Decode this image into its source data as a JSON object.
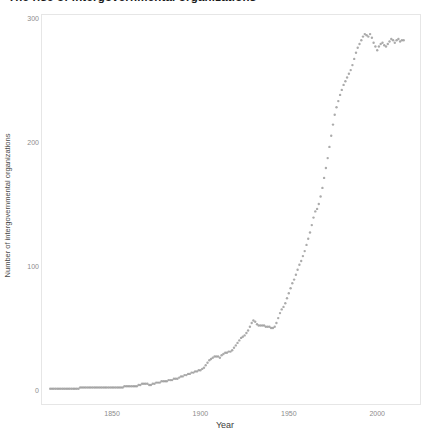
{
  "title": {
    "text": "The rise of intergovernmental organizations"
  },
  "colors": {
    "point": "#969696",
    "panel_border": "#e6e6e6",
    "tick_text": "#8c8c8c",
    "axis_title_text": "#4a4a4a",
    "background": "#ffffff"
  },
  "chart_data": {
    "type": "scatter",
    "title": "The rise of intergovernmental organizations",
    "xlabel": "Year",
    "ylabel": "Number of intergovernmental organizations",
    "x_ticks": [
      1850,
      1900,
      1950,
      2000
    ],
    "y_ticks": [
      0,
      100,
      200,
      300
    ],
    "xlim": [
      1809.8,
      2024.8
    ],
    "ylim": [
      -12.1,
      303.2
    ],
    "grid": false,
    "legend": "none",
    "series": [
      {
        "name": "igo-count",
        "points": [
          [
            1815,
            1
          ],
          [
            1816,
            1
          ],
          [
            1817,
            1
          ],
          [
            1818,
            1
          ],
          [
            1819,
            1
          ],
          [
            1820,
            1
          ],
          [
            1821,
            1
          ],
          [
            1822,
            1
          ],
          [
            1823,
            1
          ],
          [
            1824,
            1
          ],
          [
            1825,
            1
          ],
          [
            1826,
            1
          ],
          [
            1827,
            1
          ],
          [
            1828,
            1
          ],
          [
            1829,
            1
          ],
          [
            1830,
            1
          ],
          [
            1831,
            1
          ],
          [
            1832,
            2
          ],
          [
            1833,
            2
          ],
          [
            1834,
            2
          ],
          [
            1835,
            2
          ],
          [
            1836,
            2
          ],
          [
            1837,
            2
          ],
          [
            1838,
            2
          ],
          [
            1839,
            2
          ],
          [
            1840,
            2
          ],
          [
            1841,
            2
          ],
          [
            1842,
            2
          ],
          [
            1843,
            2
          ],
          [
            1844,
            2
          ],
          [
            1845,
            2
          ],
          [
            1846,
            2
          ],
          [
            1847,
            2
          ],
          [
            1848,
            2
          ],
          [
            1849,
            2
          ],
          [
            1850,
            2
          ],
          [
            1851,
            2
          ],
          [
            1852,
            2
          ],
          [
            1853,
            2
          ],
          [
            1854,
            2
          ],
          [
            1855,
            2
          ],
          [
            1856,
            2
          ],
          [
            1857,
            3
          ],
          [
            1858,
            3
          ],
          [
            1859,
            3
          ],
          [
            1860,
            3
          ],
          [
            1861,
            3
          ],
          [
            1862,
            3
          ],
          [
            1863,
            3
          ],
          [
            1864,
            3
          ],
          [
            1865,
            4
          ],
          [
            1866,
            4
          ],
          [
            1867,
            5
          ],
          [
            1868,
            5
          ],
          [
            1869,
            5
          ],
          [
            1870,
            5
          ],
          [
            1871,
            4
          ],
          [
            1872,
            4
          ],
          [
            1873,
            5
          ],
          [
            1874,
            5
          ],
          [
            1875,
            6
          ],
          [
            1876,
            6
          ],
          [
            1877,
            6
          ],
          [
            1878,
            7
          ],
          [
            1879,
            7
          ],
          [
            1880,
            7
          ],
          [
            1881,
            7
          ],
          [
            1882,
            8
          ],
          [
            1883,
            8
          ],
          [
            1884,
            8
          ],
          [
            1885,
            9
          ],
          [
            1886,
            9
          ],
          [
            1887,
            9
          ],
          [
            1888,
            10
          ],
          [
            1889,
            11
          ],
          [
            1890,
            11
          ],
          [
            1891,
            12
          ],
          [
            1892,
            12
          ],
          [
            1893,
            13
          ],
          [
            1894,
            13
          ],
          [
            1895,
            14
          ],
          [
            1896,
            14
          ],
          [
            1897,
            15
          ],
          [
            1898,
            15
          ],
          [
            1899,
            16
          ],
          [
            1900,
            16
          ],
          [
            1901,
            17
          ],
          [
            1902,
            18
          ],
          [
            1903,
            20
          ],
          [
            1904,
            22
          ],
          [
            1905,
            24
          ],
          [
            1906,
            25
          ],
          [
            1907,
            26
          ],
          [
            1908,
            27
          ],
          [
            1909,
            27
          ],
          [
            1910,
            27
          ],
          [
            1911,
            26
          ],
          [
            1912,
            28
          ],
          [
            1913,
            29
          ],
          [
            1914,
            30
          ],
          [
            1915,
            30
          ],
          [
            1916,
            31
          ],
          [
            1917,
            31
          ],
          [
            1918,
            32
          ],
          [
            1919,
            34
          ],
          [
            1920,
            36
          ],
          [
            1921,
            38
          ],
          [
            1922,
            40
          ],
          [
            1923,
            42
          ],
          [
            1924,
            43
          ],
          [
            1925,
            44
          ],
          [
            1926,
            46
          ],
          [
            1927,
            48
          ],
          [
            1928,
            51
          ],
          [
            1929,
            54
          ],
          [
            1930,
            56
          ],
          [
            1931,
            55
          ],
          [
            1932,
            53
          ],
          [
            1933,
            52
          ],
          [
            1934,
            52
          ],
          [
            1935,
            52
          ],
          [
            1936,
            52
          ],
          [
            1937,
            51
          ],
          [
            1938,
            51
          ],
          [
            1939,
            51
          ],
          [
            1940,
            50
          ],
          [
            1941,
            50
          ],
          [
            1942,
            51
          ],
          [
            1943,
            54
          ],
          [
            1944,
            58
          ],
          [
            1945,
            62
          ],
          [
            1946,
            65
          ],
          [
            1947,
            67
          ],
          [
            1948,
            70
          ],
          [
            1949,
            74
          ],
          [
            1950,
            78
          ],
          [
            1951,
            82
          ],
          [
            1952,
            86
          ],
          [
            1953,
            89
          ],
          [
            1954,
            93
          ],
          [
            1955,
            97
          ],
          [
            1956,
            101
          ],
          [
            1957,
            104
          ],
          [
            1958,
            108
          ],
          [
            1959,
            112
          ],
          [
            1960,
            117
          ],
          [
            1961,
            122
          ],
          [
            1962,
            127
          ],
          [
            1963,
            133
          ],
          [
            1964,
            139
          ],
          [
            1965,
            144
          ],
          [
            1966,
            146
          ],
          [
            1967,
            150
          ],
          [
            1968,
            156
          ],
          [
            1969,
            163
          ],
          [
            1970,
            171
          ],
          [
            1971,
            179
          ],
          [
            1972,
            187
          ],
          [
            1973,
            196
          ],
          [
            1974,
            205
          ],
          [
            1975,
            214
          ],
          [
            1976,
            222
          ],
          [
            1977,
            228
          ],
          [
            1978,
            233
          ],
          [
            1979,
            238
          ],
          [
            1980,
            242
          ],
          [
            1981,
            246
          ],
          [
            1982,
            249
          ],
          [
            1983,
            252
          ],
          [
            1984,
            255
          ],
          [
            1985,
            258
          ],
          [
            1986,
            262
          ],
          [
            1987,
            267
          ],
          [
            1988,
            272
          ],
          [
            1989,
            276
          ],
          [
            1990,
            279
          ],
          [
            1991,
            282
          ],
          [
            1992,
            285
          ],
          [
            1993,
            287
          ],
          [
            1994,
            286
          ],
          [
            1995,
            285
          ],
          [
            1996,
            287
          ],
          [
            1997,
            284
          ],
          [
            1998,
            280
          ],
          [
            1999,
            277
          ],
          [
            2000,
            274
          ],
          [
            2001,
            277
          ],
          [
            2002,
            279
          ],
          [
            2003,
            280
          ],
          [
            2004,
            278
          ],
          [
            2005,
            277
          ],
          [
            2006,
            279
          ],
          [
            2007,
            281
          ],
          [
            2008,
            283
          ],
          [
            2009,
            282
          ],
          [
            2010,
            280
          ],
          [
            2011,
            282
          ],
          [
            2012,
            283
          ],
          [
            2013,
            281
          ],
          [
            2014,
            282
          ],
          [
            2015,
            282
          ]
        ]
      }
    ]
  }
}
